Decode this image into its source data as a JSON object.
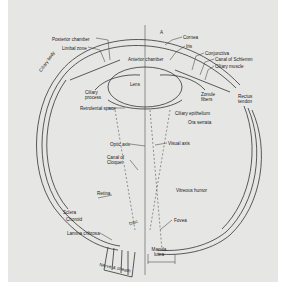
{
  "diagram": {
    "background_color": "#e6e6e4",
    "line_color": "#333333",
    "labels": [
      {
        "id": "posterior-chamber",
        "text": "Posterior chamber",
        "x": 52,
        "y": 37
      },
      {
        "id": "limbal-zone",
        "text": "Limbal zone",
        "x": 62,
        "y": 46
      },
      {
        "id": "ciliary-body",
        "text": "Ciliary body",
        "x": 42,
        "y": 72
      },
      {
        "id": "ciliary-process",
        "text": "Ciliary process",
        "x": 85,
        "y": 90
      },
      {
        "id": "retrolental-space",
        "text": "Retrolental space",
        "x": 80,
        "y": 106
      },
      {
        "id": "anterior-chamber",
        "text": "Anterior chamber",
        "x": 130,
        "y": 57
      },
      {
        "id": "lens",
        "text": "Lens",
        "x": 130,
        "y": 82
      },
      {
        "id": "cornea",
        "text": "Cornea",
        "x": 183,
        "y": 35
      },
      {
        "id": "iris",
        "text": "Iris",
        "x": 186,
        "y": 44
      },
      {
        "id": "conjunctiva",
        "text": "Conjunctiva",
        "x": 205,
        "y": 51
      },
      {
        "id": "canal-of-schlemm",
        "text": "Canal of Schlemm",
        "x": 215,
        "y": 57
      },
      {
        "id": "ciliary-muscle",
        "text": "Ciliary muscle",
        "x": 215,
        "y": 64
      },
      {
        "id": "zonule-fibers",
        "text": "Zonule fibers",
        "x": 201,
        "y": 94
      },
      {
        "id": "rectus-tendon",
        "text": "Rectus tendon",
        "x": 240,
        "y": 96
      },
      {
        "id": "ciliary-epithelium",
        "text": "Ciliary epithelium",
        "x": 175,
        "y": 111
      },
      {
        "id": "ora-serrata",
        "text": "Ora serrata",
        "x": 188,
        "y": 120
      },
      {
        "id": "optic-axis",
        "text": "Optic axis",
        "x": 110,
        "y": 142
      },
      {
        "id": "visual-axis",
        "text": "Visual axis",
        "x": 168,
        "y": 141
      },
      {
        "id": "canal-of-cloquet",
        "text": "Canal of Cloquet",
        "x": 107,
        "y": 157
      },
      {
        "id": "vitreous-humor",
        "text": "Vitreous humor",
        "x": 176,
        "y": 188
      },
      {
        "id": "retina",
        "text": "Retina",
        "x": 97,
        "y": 193
      },
      {
        "id": "sclera",
        "text": "Sclera",
        "x": 63,
        "y": 210
      },
      {
        "id": "choroid",
        "text": "Choroid",
        "x": 66,
        "y": 217
      },
      {
        "id": "lamina-cribrosa",
        "text": "Lamina cribrosa",
        "x": 67,
        "y": 231
      },
      {
        "id": "fovea",
        "text": "Fovea",
        "x": 174,
        "y": 218
      },
      {
        "id": "macula-lutea",
        "text": "Macula lutea",
        "x": 148,
        "y": 246
      },
      {
        "id": "nerve-and-sheath",
        "text": "Nerve & sheath",
        "x": 102,
        "y": 262
      },
      {
        "id": "disc",
        "text": "Disc",
        "x": 129,
        "y": 222
      },
      {
        "id": "axis-marker-a",
        "text": "A",
        "x": 160,
        "y": 32
      }
    ]
  }
}
